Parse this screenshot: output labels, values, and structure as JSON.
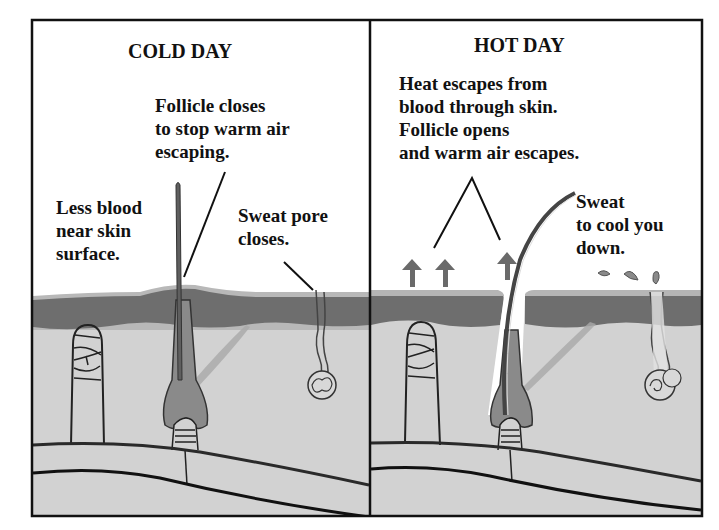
{
  "figure": {
    "colors": {
      "frame": "#111111",
      "background": "#ffffff",
      "epidermis_top": "#b5b5b5",
      "epidermis": "#6e6e6e",
      "dermis": "#d2d2d2",
      "hair": "#5f5f5f",
      "arrow": "#6a6a6a",
      "vessel_line": "#222222"
    }
  },
  "panels": [
    {
      "id": "cold",
      "title": "COLD DAY",
      "labels": [
        {
          "id": "follicle",
          "text": "Follicle closes\nto stop warm air\nescaping."
        },
        {
          "id": "blood",
          "text": "Less blood\nnear skin\nsurface."
        },
        {
          "id": "sweat",
          "text": "Sweat pore\ncloses."
        }
      ]
    },
    {
      "id": "hot",
      "title": "HOT DAY",
      "labels": [
        {
          "id": "heat",
          "text": "Heat escapes from\nblood through skin.\nFollicle opens\nand warm air escapes."
        },
        {
          "id": "sweat",
          "text": "Sweat\nto cool you\ndown."
        }
      ],
      "arrows": 3,
      "sweat_drops": 3
    }
  ]
}
